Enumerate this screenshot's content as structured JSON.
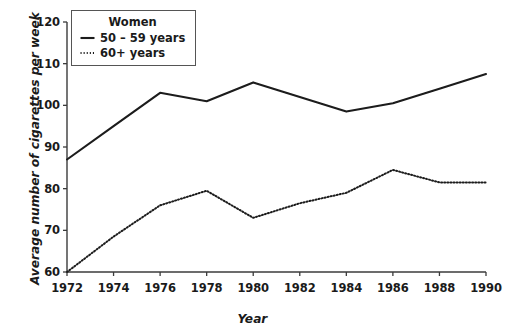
{
  "chart_data": {
    "type": "line",
    "title": "",
    "xlabel": "Year",
    "ylabel": "Average number of cigarettes per week",
    "xlim": [
      1972,
      1990
    ],
    "ylim": [
      60,
      120
    ],
    "grid": false,
    "legend_position": "top-left",
    "legend_title": "Women",
    "x": [
      1972,
      1974,
      1976,
      1978,
      1980,
      1982,
      1984,
      1986,
      1988,
      1990
    ],
    "xticks": [
      "1972",
      "1974",
      "1976",
      "1978",
      "1980",
      "1982",
      "1984",
      "1986",
      "1988",
      "1990"
    ],
    "yticks": [
      "60",
      "70",
      "80",
      "90",
      "100",
      "110",
      "120"
    ],
    "series": [
      {
        "name": "50 – 59 years",
        "style": "solid",
        "color": "#1c1c1c",
        "values": [
          87,
          95,
          103,
          101,
          105.5,
          102,
          98.5,
          100.5,
          104,
          107.5
        ]
      },
      {
        "name": "60+ years",
        "style": "dotted",
        "color": "#1c1c1c",
        "values": [
          60,
          68.5,
          76,
          79.5,
          73,
          76.5,
          79,
          84.5,
          81.5,
          81.5
        ]
      }
    ]
  },
  "axes": {
    "x_title": "Year",
    "y_title": "Average number of cigarettes per week"
  },
  "legend": {
    "title": "Women",
    "items": [
      {
        "label": "50 – 59 years",
        "style": "solid"
      },
      {
        "label": "60+ years",
        "style": "dotted"
      }
    ]
  }
}
